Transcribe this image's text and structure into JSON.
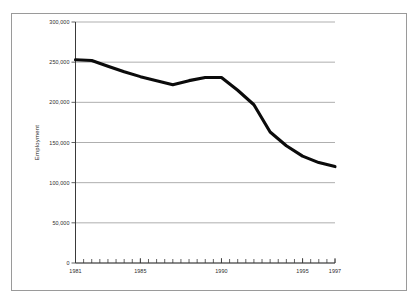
{
  "figure": {
    "title_remnant": "·  ·",
    "frame_color": "#9a9a9a",
    "background": "#ffffff"
  },
  "chart_data": {
    "type": "line",
    "title": "",
    "xlabel": "",
    "ylabel": "Employment",
    "xlim": [
      1981,
      1997
    ],
    "ylim": [
      0,
      300000
    ],
    "grid": true,
    "legend": "none",
    "line_color": "#0b0b0b",
    "y_ticks": [
      0,
      50000,
      100000,
      150000,
      200000,
      250000,
      300000
    ],
    "y_tick_labels": [
      "0",
      "50,000",
      "100,000",
      "150,000",
      "200,000",
      "250,000",
      "300,000"
    ],
    "x_ticks": [
      1981,
      1985,
      1990,
      1995,
      1997
    ],
    "x_tick_labels": [
      "1981",
      "1985",
      "1990",
      "1995",
      "1997"
    ],
    "x_minor_tick_interval": 0.5,
    "x": [
      1981,
      1982,
      1983,
      1984,
      1985,
      1986,
      1987,
      1988,
      1989,
      1990,
      1991,
      1992,
      1993,
      1994,
      1995,
      1996,
      1997
    ],
    "values": [
      253000,
      252000,
      245000,
      238000,
      232000,
      227000,
      222000,
      227000,
      231000,
      231000,
      215000,
      197000,
      163000,
      146000,
      133000,
      125000,
      120000
    ],
    "series": [
      {
        "name": "Employment",
        "values": [
          253000,
          252000,
          245000,
          238000,
          232000,
          227000,
          222000,
          227000,
          231000,
          231000,
          215000,
          197000,
          163000,
          146000,
          133000,
          125000,
          120000
        ]
      }
    ]
  }
}
